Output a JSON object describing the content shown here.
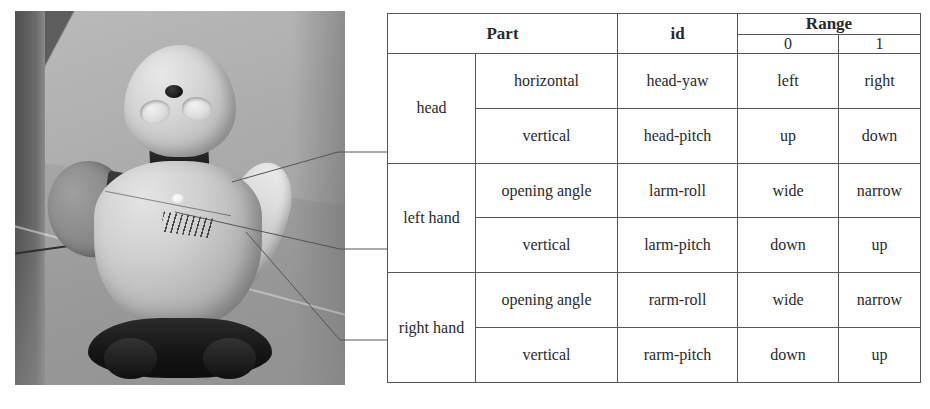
{
  "figure": {
    "photo": {
      "name": "robot-photograph",
      "subject": "humanoid desktop robot",
      "parts_visible": [
        "head",
        "left hand",
        "right hand"
      ]
    },
    "leaders": [
      {
        "label": "head",
        "target_row": "head"
      },
      {
        "label": "left hand",
        "target_row": "left hand"
      },
      {
        "label": "right hand",
        "target_row": "right hand"
      }
    ]
  },
  "table": {
    "headers": {
      "part": "Part",
      "id": "id",
      "range": "Range",
      "range_0": "0",
      "range_1": "1"
    },
    "groups": [
      {
        "part": "head",
        "rows": [
          {
            "motion": "horizontal",
            "id": "head-yaw",
            "r0": "left",
            "r1": "right"
          },
          {
            "motion": "vertical",
            "id": "head-pitch",
            "r0": "up",
            "r1": "down"
          }
        ]
      },
      {
        "part": "left hand",
        "rows": [
          {
            "motion": "opening angle",
            "id": "larm-roll",
            "r0": "wide",
            "r1": "narrow"
          },
          {
            "motion": "vertical",
            "id": "larm-pitch",
            "r0": "down",
            "r1": "up"
          }
        ]
      },
      {
        "part": "right hand",
        "rows": [
          {
            "motion": "opening angle",
            "id": "rarm-roll",
            "r0": "wide",
            "r1": "narrow"
          },
          {
            "motion": "vertical",
            "id": "rarm-pitch",
            "r0": "down",
            "r1": "up"
          }
        ]
      }
    ]
  },
  "colors": {
    "border": "#55555a",
    "text": "#2a2a2a",
    "page_background": "#ffffff"
  }
}
